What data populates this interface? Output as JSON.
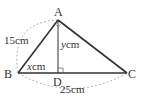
{
  "diagram": {
    "type": "geometry-triangle",
    "vertices": {
      "A": {
        "label": "A",
        "x": 58,
        "y": 20
      },
      "B": {
        "label": "B",
        "x": 18,
        "y": 73
      },
      "C": {
        "label": "C",
        "x": 127,
        "y": 73
      },
      "D": {
        "label": "D",
        "x": 58,
        "y": 73
      }
    },
    "measurements": {
      "AB": {
        "value": "15",
        "unit": "cm"
      },
      "BC": {
        "value": "25",
        "unit": "cm"
      },
      "BD": {
        "variable": "x",
        "unit": "cm"
      },
      "AD": {
        "variable": "y",
        "unit": "cm"
      }
    },
    "labels": {
      "A": "A",
      "B": "B",
      "C": "C",
      "D": "D",
      "ab_length": "15cm",
      "bc_length": "25cm",
      "bd_var": "x",
      "bd_unit": "cm",
      "ad_var": "y",
      "ad_unit": "cm"
    },
    "colors": {
      "stroke": "#333333",
      "dashed": "#999999"
    }
  }
}
